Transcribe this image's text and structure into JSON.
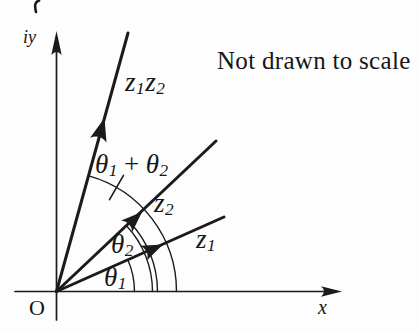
{
  "figure": {
    "note": "Not drawn to scale",
    "axes": {
      "y_label": "iy",
      "x_label": "x",
      "origin_label": "O"
    },
    "vectors": {
      "z1": {
        "base": "z",
        "sub": "1"
      },
      "z2": {
        "base": "z",
        "sub": "2"
      },
      "z1z2": {
        "base1": "z",
        "sub1": "1",
        "base2": "z",
        "sub2": "2"
      }
    },
    "angles": {
      "theta1": {
        "base": "θ",
        "sub": "1"
      },
      "theta2": {
        "base": "θ",
        "sub": "2"
      },
      "theta_sum": {
        "base1": "θ",
        "sub1": "1",
        "operator": "+",
        "base2": "θ",
        "sub2": "2"
      }
    },
    "colors": {
      "ink": "#1b1b1b",
      "background": "#fdfdfd"
    }
  }
}
